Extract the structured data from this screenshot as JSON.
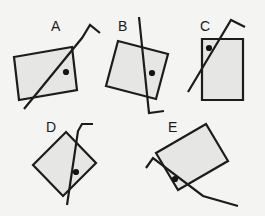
{
  "canvas": {
    "width": 265,
    "height": 216,
    "background_color": "#f4f4f2",
    "shape_fill_color": "#e6e6e4",
    "stroke_color": "#1c1c1c",
    "dot_color": "#141414"
  },
  "figures": [
    {
      "label": "A",
      "label_x": 51,
      "label_y": 31,
      "rect_points": "14,57 72,47 77,90 19,100",
      "line_points": "24,109 82,38 90,25 100,33",
      "dot_cx": 66,
      "dot_cy": 72,
      "dot_r": 3.1
    },
    {
      "label": "B",
      "label_x": 118,
      "label_y": 31,
      "rect_points": "118,41 168,54 156,99 106,86",
      "line_points": "139,17 149,113 164,111",
      "dot_cx": 152,
      "dot_cy": 73,
      "dot_r": 3.1
    },
    {
      "label": "C",
      "label_x": 200,
      "label_y": 31,
      "rect_points": "202,39 243,39 243,100 202,100",
      "line_points": "188,92 231,20 245,27",
      "dot_cx": 209,
      "dot_cy": 48,
      "dot_r": 3.1
    },
    {
      "label": "D",
      "label_x": 46,
      "label_y": 132,
      "rect_points": "66,132 96,163 63,196 33,165",
      "line_points": "67,205 78,131 82,124 93,124",
      "dot_cx": 76,
      "dot_cy": 172,
      "dot_r": 3.1
    },
    {
      "label": "E",
      "label_x": 168,
      "label_y": 132,
      "rect_points": "156,153 206,124 228,161 178,190",
      "line_points": "146,168 153,158 203,196 238,206",
      "dot_cx": 175,
      "dot_cy": 179,
      "dot_r": 3.1
    }
  ]
}
